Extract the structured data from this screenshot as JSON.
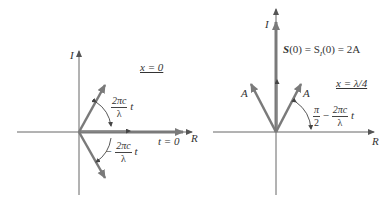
{
  "left_diagram": {
    "axis_vertical_label": "I",
    "axis_horizontal_label": "R",
    "position_label": "x = 0",
    "upper_angle": {
      "numerator": "2πc",
      "denominator": "λ",
      "suffix": "t"
    },
    "lower_angle": {
      "prefix": "−",
      "numerator": "2πc",
      "denominator": "λ",
      "suffix": "t"
    },
    "time_label": "t = 0"
  },
  "right_diagram": {
    "axis_vertical_label": "I",
    "axis_horizontal_label": "R",
    "position_label": "x = λ/4",
    "sum_label_S": "S",
    "sum_label_rest": "(0) = S",
    "sum_label_sub": "I",
    "sum_label_end": "(0) = 2A",
    "left_vector_label": "A",
    "right_vector_label": "A",
    "angle": {
      "numerator": "π",
      "denominator": "2",
      "minus": "−",
      "numerator2": "2πc",
      "denominator2": "λ",
      "suffix": "t"
    }
  },
  "colors": {
    "axis": "#555555",
    "vector": "#7a7a7a",
    "text": "#333333"
  }
}
